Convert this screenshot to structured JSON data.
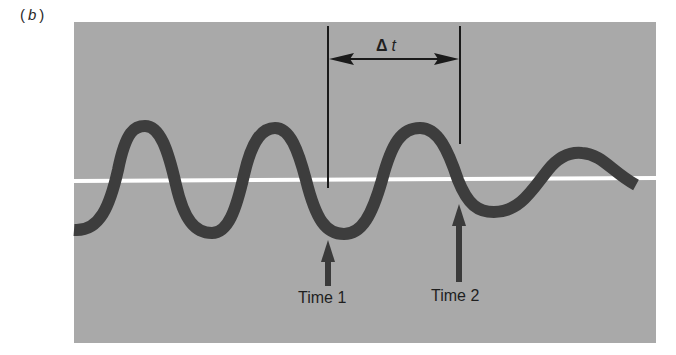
{
  "figure": {
    "panel_label_open": "(",
    "panel_label_letter": "b",
    "panel_label_close": ")",
    "interval_label_delta": "Δ",
    "interval_label_t": "t",
    "time_markers": [
      {
        "label": "Time 1",
        "x": 328
      },
      {
        "label": "Time 2",
        "x": 459
      }
    ],
    "colors": {
      "background": "#ffffff",
      "panel": "#a9a9a9",
      "wave": "#3d3d3d",
      "baseline": "#ffffff",
      "annotation": "#1f1f1f"
    }
  }
}
